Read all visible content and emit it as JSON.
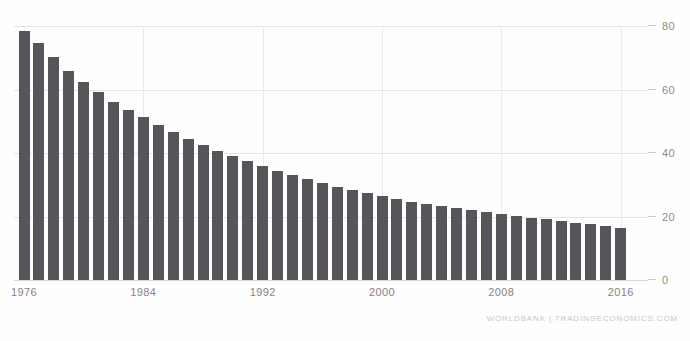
{
  "chart_data": {
    "type": "bar",
    "title": "",
    "subtitle": "",
    "xlabel": "",
    "ylabel": "",
    "ylim": [
      0,
      80
    ],
    "yticks": [
      0,
      20,
      40,
      60,
      80
    ],
    "xticks": [
      "1976",
      "1984",
      "1992",
      "2000",
      "2008",
      "2016"
    ],
    "grid": true,
    "legend": null,
    "bar_color": "#55555a",
    "categories": [
      "1976",
      "1977",
      "1978",
      "1979",
      "1980",
      "1981",
      "1982",
      "1983",
      "1984",
      "1985",
      "1986",
      "1987",
      "1988",
      "1989",
      "1990",
      "1991",
      "1992",
      "1993",
      "1994",
      "1995",
      "1996",
      "1997",
      "1998",
      "1999",
      "2000",
      "2001",
      "2002",
      "2003",
      "2004",
      "2005",
      "2006",
      "2007",
      "2008",
      "2009",
      "2010",
      "2011",
      "2012",
      "2013",
      "2014",
      "2015",
      "2016"
    ],
    "values": [
      78.5,
      74.6,
      70.2,
      65.8,
      62.4,
      59.2,
      56.1,
      53.6,
      51.3,
      48.9,
      46.6,
      44.4,
      42.4,
      40.6,
      39.0,
      37.4,
      35.9,
      34.4,
      33.1,
      31.8,
      30.5,
      29.4,
      28.3,
      27.3,
      26.4,
      25.5,
      24.7,
      24.0,
      23.3,
      22.6,
      21.9,
      21.3,
      20.7,
      20.2,
      19.6,
      19.1,
      18.6,
      18.1,
      17.5,
      17.0,
      16.4
    ]
  },
  "footer": {
    "source_credit": "WORLDBANK | TRADINGECONOMICS.COM"
  }
}
